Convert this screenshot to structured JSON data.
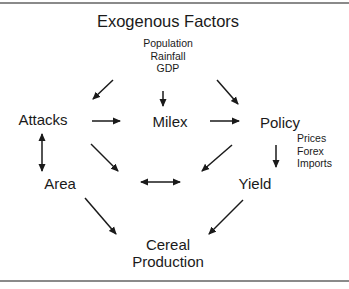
{
  "diagram": {
    "title": "Exogenous Factors",
    "exogenous_factors": [
      "Population",
      "Rainfall",
      "GDP"
    ],
    "nodes": {
      "attacks": "Attacks",
      "milex": "Milex",
      "policy": "Policy",
      "area": "Area",
      "yield": "Yield",
      "cereal_production": [
        "Cereal",
        "Production"
      ]
    },
    "policy_factors": [
      "Prices",
      "Forex",
      "Imports"
    ],
    "edges": [
      {
        "from": "Exogenous Factors",
        "to": "Attacks",
        "type": "directed"
      },
      {
        "from": "Exogenous Factors",
        "to": "Milex",
        "type": "directed"
      },
      {
        "from": "Exogenous Factors",
        "to": "Policy",
        "type": "directed"
      },
      {
        "from": "Attacks",
        "to": "Milex",
        "type": "directed"
      },
      {
        "from": "Milex",
        "to": "Policy",
        "type": "directed"
      },
      {
        "from": "Attacks",
        "to": "Area",
        "type": "bidirectional"
      },
      {
        "from": "Attacks",
        "to": "Area/Yield center",
        "type": "directed"
      },
      {
        "from": "Milex",
        "to": "Area/Yield center",
        "type": "directed"
      },
      {
        "from": "Policy",
        "to": "Yield",
        "type": "directed"
      },
      {
        "from": "Area",
        "to": "Yield",
        "type": "bidirectional"
      },
      {
        "from": "Area",
        "to": "Cereal Production",
        "type": "directed"
      },
      {
        "from": "Yield",
        "to": "Cereal Production",
        "type": "directed"
      }
    ],
    "colors": {
      "line": "#1a1a1a",
      "rule": "#8a8a8a"
    }
  }
}
